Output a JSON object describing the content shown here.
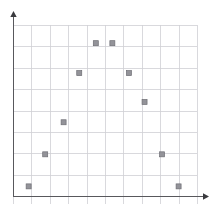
{
  "chart_data": {
    "type": "scatter",
    "title": "",
    "subtitle": "",
    "xlabel": "",
    "ylabel": "",
    "xlim": [
      0,
      10
    ],
    "ylim": [
      0,
      8
    ],
    "grid": true,
    "legend": false,
    "legend_position": "none",
    "xticks": [
      0,
      1,
      2,
      3,
      4,
      5,
      6,
      7,
      8,
      9,
      10
    ],
    "yticks": [
      0,
      1,
      2,
      3,
      4,
      5,
      6,
      7,
      8
    ],
    "xticklabels": [
      "",
      "",
      "",
      "",
      "",
      "",
      "",
      "",
      "",
      "",
      ""
    ],
    "yticklabels": [
      "",
      "",
      "",
      "",
      "",
      "",
      "",
      "",
      ""
    ],
    "annotations": [],
    "series": [
      {
        "name": "series-1",
        "marker": "square",
        "marker_color": "#939399",
        "marker_edge_color": "#6e6e74",
        "x": [
          0.85,
          1.75,
          2.75,
          3.6,
          4.5,
          5.4,
          6.3,
          7.15,
          8.1,
          9.0
        ],
        "y": [
          0.45,
          1.95,
          3.45,
          5.75,
          7.15,
          7.15,
          5.75,
          4.4,
          1.95,
          0.45
        ]
      }
    ]
  },
  "plot": {
    "geometry": {
      "width": 214,
      "height": 206,
      "plot_left": 13,
      "plot_right": 197,
      "plot_top": 25,
      "plot_bottom": 196,
      "x_axis_y": 196,
      "y_axis_x": 13,
      "cols": 9,
      "rows": 8,
      "cell_width": 20.4,
      "cell_height": 21.4,
      "marker_size": 5
    },
    "colors": {
      "background": "#ffffff",
      "grid": "#cfcfd4",
      "axis": "#58585c",
      "marker_fill": "#939399",
      "marker_edge": "#6e6e74"
    },
    "axes": {
      "y_axis_has_arrow": true,
      "x_axis_has_arrow": true,
      "y_arrow_direction": "up",
      "x_arrow_direction": "right"
    }
  }
}
